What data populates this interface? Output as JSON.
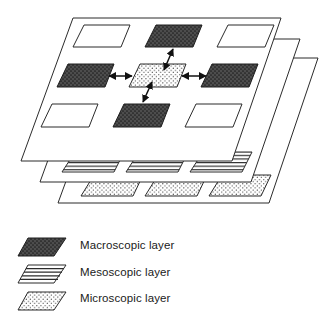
{
  "figure": {
    "title": "",
    "stroke_color": "#2b2b2b",
    "background_color": "#ffffff"
  },
  "diagram_data": {
    "type": "diagram",
    "layer_count": 3,
    "layers": [
      {
        "name": "macroscopic-plane",
        "index": 0,
        "label": "Macroscopic layer",
        "fill": "#ffffff",
        "outline": "#2b2b2b",
        "node_count": 9,
        "nodes": [
          {
            "id": "n-top-left",
            "row": 0,
            "col": 0,
            "pattern": "plain",
            "fill": "#ffffff"
          },
          {
            "id": "n-top-center",
            "row": 0,
            "col": 1,
            "pattern": "dark-stipple",
            "fill": "#4d4d4d"
          },
          {
            "id": "n-top-right",
            "row": 0,
            "col": 2,
            "pattern": "plain",
            "fill": "#ffffff"
          },
          {
            "id": "n-mid-left",
            "row": 1,
            "col": 0,
            "pattern": "dark-stipple",
            "fill": "#4d4d4d"
          },
          {
            "id": "n-center",
            "row": 1,
            "col": 1,
            "pattern": "light-dot",
            "fill": "#ffffff"
          },
          {
            "id": "n-mid-right",
            "row": 1,
            "col": 2,
            "pattern": "dark-stipple",
            "fill": "#4d4d4d"
          },
          {
            "id": "n-bot-left",
            "row": 2,
            "col": 0,
            "pattern": "plain",
            "fill": "#ffffff"
          },
          {
            "id": "n-bot-center",
            "row": 2,
            "col": 1,
            "pattern": "dark-stipple",
            "fill": "#4d4d4d"
          },
          {
            "id": "n-bot-right",
            "row": 2,
            "col": 2,
            "pattern": "plain",
            "fill": "#ffffff"
          }
        ],
        "connections": [
          {
            "from": "n-center",
            "to": "n-top-center",
            "style": "double-headed-arrow"
          },
          {
            "from": "n-center",
            "to": "n-bot-center",
            "style": "double-headed-arrow"
          },
          {
            "from": "n-center",
            "to": "n-mid-left",
            "style": "double-headed-arrow"
          },
          {
            "from": "n-center",
            "to": "n-mid-right",
            "style": "double-headed-arrow"
          }
        ]
      },
      {
        "name": "mesoscopic-plane",
        "index": 1,
        "label": "Mesoscopic layer",
        "fill": "#ffffff",
        "outline": "#2b2b2b",
        "node_count": 3,
        "nodes": [
          {
            "id": "m-1",
            "pattern": "horizontal-lines",
            "fill": "#ffffff"
          },
          {
            "id": "m-2",
            "pattern": "horizontal-lines",
            "fill": "#ffffff"
          },
          {
            "id": "m-3",
            "pattern": "horizontal-lines",
            "fill": "#ffffff"
          }
        ],
        "connections": []
      },
      {
        "name": "microscopic-plane",
        "index": 2,
        "label": "Microscopic layer",
        "fill": "#ffffff",
        "outline": "#2b2b2b",
        "node_count": 3,
        "nodes": [
          {
            "id": "u-1",
            "pattern": "light-dot",
            "fill": "#ffffff"
          },
          {
            "id": "u-2",
            "pattern": "light-dot",
            "fill": "#ffffff"
          },
          {
            "id": "u-3",
            "pattern": "light-dot",
            "fill": "#ffffff"
          }
        ],
        "connections": []
      }
    ]
  },
  "legend": {
    "position": "bottom-left",
    "items": [
      {
        "key": "macroscopic",
        "label": "Macroscopic layer",
        "pattern": "dark-stipple",
        "fill": "#4d4d4d",
        "swatch_name": "macroscopic-swatch"
      },
      {
        "key": "mesoscopic",
        "label": "Mesoscopic layer",
        "pattern": "horizontal-lines",
        "fill": "#ffffff",
        "swatch_name": "mesoscopic-swatch"
      },
      {
        "key": "microscopic",
        "label": "Microscopic layer",
        "pattern": "light-dot",
        "fill": "#ffffff",
        "swatch_name": "microscopic-swatch"
      }
    ]
  }
}
